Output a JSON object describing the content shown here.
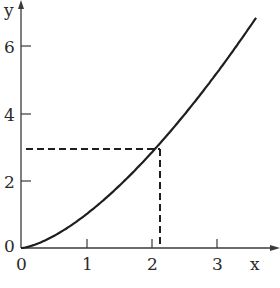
{
  "chart_data": {
    "type": "line",
    "title": "",
    "xlabel": "x",
    "ylabel": "y",
    "xlim": [
      0,
      3.6
    ],
    "ylim": [
      0,
      7.3
    ],
    "x_ticks": [
      0,
      1,
      2,
      3
    ],
    "x_tick_labels": [
      "0",
      "1",
      "2",
      "3"
    ],
    "y_ticks": [
      0,
      2,
      4,
      6
    ],
    "y_tick_labels": [
      "0",
      "2",
      "4",
      "6"
    ],
    "grid": false,
    "legend": null,
    "series": [
      {
        "name": "curve",
        "style": "solid",
        "function": "y = x^1.5",
        "x": [
          0,
          0.5,
          1.0,
          1.5,
          2.0,
          2.08,
          2.5,
          3.0,
          3.5,
          3.55
        ],
        "y": [
          0,
          0.35,
          1.0,
          1.84,
          2.83,
          3.0,
          3.95,
          5.2,
          6.55,
          6.7
        ]
      }
    ],
    "annotations": [
      {
        "type": "dashed-guide",
        "point": {
          "x": 2.08,
          "y": 3.0
        },
        "description": "dashed horizontal line from y-axis at y=3 to the curve, and dashed vertical line from the curve down to the x-axis at x≈2.08"
      }
    ]
  },
  "labels": {
    "x_axis": "x",
    "y_axis": "y",
    "x_ticks": [
      "0",
      "1",
      "2",
      "3"
    ],
    "y_ticks": [
      "0",
      "2",
      "4",
      "6"
    ]
  }
}
